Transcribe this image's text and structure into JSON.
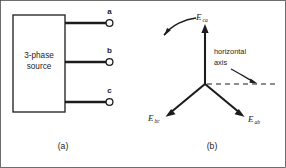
{
  "figure": {
    "panels": [
      {
        "caption": "(a)",
        "source_label_line1": "3-phase",
        "source_label_line2": "source",
        "terminals": [
          {
            "name": "a",
            "label": "a"
          },
          {
            "name": "b",
            "label": "b"
          },
          {
            "name": "c",
            "label": "c"
          }
        ]
      },
      {
        "caption": "(b)",
        "axis_label_line1": "horizontal",
        "axis_label_line2": "axis",
        "phasors": [
          {
            "name": "E-ca",
            "symbol": "E",
            "subscript": "ca",
            "angle_deg": 90,
            "direction": "up"
          },
          {
            "name": "E-bc",
            "symbol": "E",
            "subscript": "bc",
            "angle_deg": 210,
            "direction": "lower-left"
          },
          {
            "name": "E-ab",
            "symbol": "E",
            "subscript": "ab",
            "angle_deg": 330,
            "direction": "lower-right"
          }
        ],
        "rotation_arrow": "counterclockwise"
      }
    ],
    "colors": {
      "ink": "#1c1c1c",
      "frame": "#4a4a4a",
      "background": "#ffffff"
    }
  }
}
